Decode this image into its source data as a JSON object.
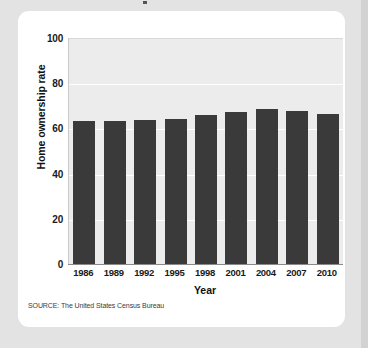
{
  "card": {
    "background_color": "#ffffff",
    "page_background_color": "#e3e3e3"
  },
  "chart_data": {
    "type": "bar",
    "title": "",
    "categories": [
      "1986",
      "1989",
      "1992",
      "1995",
      "1998",
      "2001",
      "2004",
      "2007",
      "2010"
    ],
    "values": [
      63.8,
      63.9,
      64.1,
      64.7,
      66.3,
      67.8,
      69.0,
      68.1,
      66.9
    ],
    "xlabel": "Year",
    "ylabel": "Home ownership rate",
    "ylim": [
      0,
      100
    ],
    "yticks": [
      0,
      20,
      40,
      60,
      80,
      100
    ],
    "ytick_labels": [
      "0",
      "20",
      "40",
      "60",
      "80",
      "100"
    ],
    "grid": true,
    "grid_color": "#ffffff",
    "legend": "none",
    "bar_color": "#3a3a3a",
    "plot_background_color": "#ececec",
    "source": "SOURCE: The United States Census Bureau"
  }
}
